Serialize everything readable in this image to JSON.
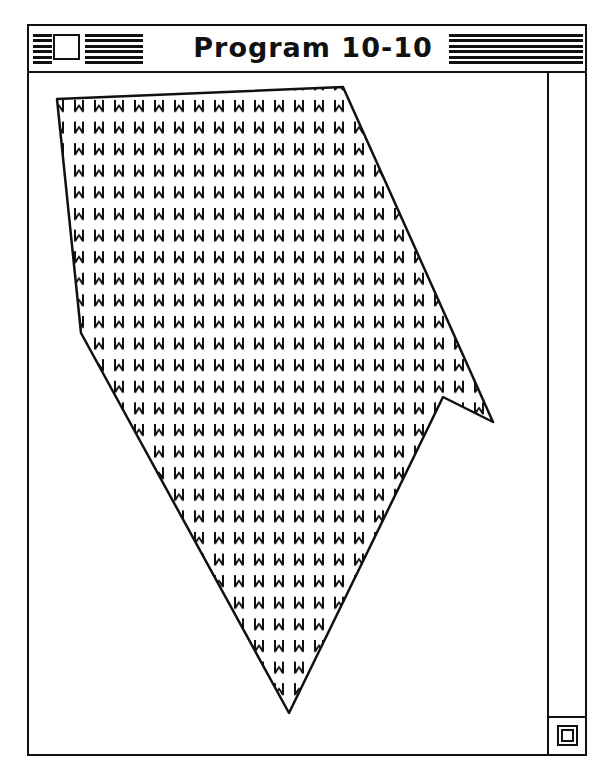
{
  "window": {
    "title": "Program 10-10",
    "close_box_icon": "close-box",
    "grow_box_icon": "grow-box"
  },
  "drawing": {
    "shape": "polygon",
    "fill_pattern": "W",
    "stroke_color": "#111111",
    "fill_background": "#ffffff",
    "pattern_tile": {
      "width": 20,
      "height": 21.6
    },
    "vertices": [
      [
        57,
        99
      ],
      [
        343,
        87
      ],
      [
        493,
        422
      ],
      [
        443,
        397
      ],
      [
        289,
        713
      ],
      [
        81,
        333
      ]
    ]
  }
}
